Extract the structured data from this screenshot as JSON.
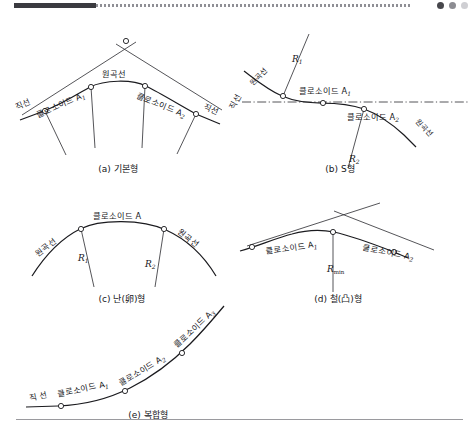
{
  "page": {
    "language": "ko",
    "background_color": "#ffffff",
    "ink_color": "#1b1b1f",
    "top_bar": {
      "solid_color": "#3b3b40",
      "dotted_color": "#8f8f95",
      "dots": [
        "#47474c",
        "#8c8c92",
        "#cfcfd3"
      ]
    },
    "bottom_rule_color": "#9a9a9e"
  },
  "terms": {
    "straight_line": "직선",
    "straight_line_spaced": "직 선",
    "circular_curve": "원곡선",
    "clothoid": "클로소이드",
    "clothoid_A": "클로소이드 A",
    "clothoid_A1": "클로소이드 A",
    "clothoid_A2": "클로소이드 A",
    "clothoid_A3": "클로소이드 A",
    "sub_1": "1",
    "sub_2": "2",
    "sub_3": "3",
    "R": "R",
    "R_sub_1": "1",
    "R_sub_2": "2",
    "R_sub_min": "min"
  },
  "figures": [
    {
      "id": "a",
      "caption": "(a) 기본형",
      "caption_label": "(a)",
      "caption_name": "기본형",
      "labels": [
        {
          "name": "straight-line-left",
          "text": "직선",
          "rotation": -24
        },
        {
          "name": "clothoid-a1",
          "text": "클로소이드 A",
          "subscript": "1",
          "rotation": -24
        },
        {
          "name": "circular-curve",
          "text": "원곡선",
          "rotation": 0
        },
        {
          "name": "clothoid-a2",
          "text": "클로소이드 A",
          "subscript": "2",
          "rotation": 22
        },
        {
          "name": "straight-line-right",
          "text": "직선",
          "rotation": 22
        }
      ]
    },
    {
      "id": "b",
      "caption": "(b) S형",
      "caption_label": "(b)",
      "caption_name": "S형",
      "labels": [
        {
          "name": "straight-line-left",
          "text": "직선",
          "rotation": -62
        },
        {
          "name": "circular-curve-upper",
          "text": "원곡선",
          "rotation": -46
        },
        {
          "name": "radius-r1",
          "text": "R",
          "subscript": "1"
        },
        {
          "name": "clothoid-a1",
          "text": "클로소이드 A",
          "subscript": "1",
          "rotation": 0
        },
        {
          "name": "clothoid-a2",
          "text": "클로소이드 A",
          "subscript": "2",
          "rotation": 0
        },
        {
          "name": "radius-r2",
          "text": "R",
          "subscript": "2"
        },
        {
          "name": "circular-curve-lower",
          "text": "원곡선",
          "rotation": 47
        }
      ]
    },
    {
      "id": "c",
      "caption": "(c) 난(卵)형",
      "caption_label": "(c)",
      "caption_name": "난(卵)형",
      "labels": [
        {
          "name": "circular-curve-left",
          "text": "원곡선",
          "rotation": -38
        },
        {
          "name": "clothoid-a",
          "text": "클로소이드 A",
          "rotation": 0
        },
        {
          "name": "circular-curve-right",
          "text": "원곡선",
          "rotation": 38
        },
        {
          "name": "radius-r1",
          "text": "R",
          "subscript": "1"
        },
        {
          "name": "radius-r2",
          "text": "R",
          "subscript": "2"
        }
      ]
    },
    {
      "id": "d",
      "caption": "(d) 철(凸)형",
      "caption_label": "(d)",
      "caption_name": "철(凸)형",
      "labels": [
        {
          "name": "clothoid-a1",
          "text": "클로소이드 A",
          "subscript": "1",
          "rotation": -8
        },
        {
          "name": "clothoid-a2",
          "text": "클로소이드 A",
          "subscript": "2",
          "rotation": 11
        },
        {
          "name": "radius-rmin",
          "text": "R",
          "subscript": "min"
        }
      ]
    },
    {
      "id": "e",
      "caption": "(e) 복합형",
      "caption_label": "(e)",
      "caption_name": "복합형",
      "labels": [
        {
          "name": "straight-line",
          "text": "직 선",
          "rotation": -12
        },
        {
          "name": "clothoid-a1",
          "text": "클로소이드 A",
          "subscript": "1",
          "rotation": -12
        },
        {
          "name": "clothoid-a2",
          "text": "클로소이드 A",
          "subscript": "2",
          "rotation": -31
        },
        {
          "name": "clothoid-a3",
          "text": "클로소이드 A",
          "subscript": "3",
          "rotation": -43
        }
      ]
    }
  ]
}
